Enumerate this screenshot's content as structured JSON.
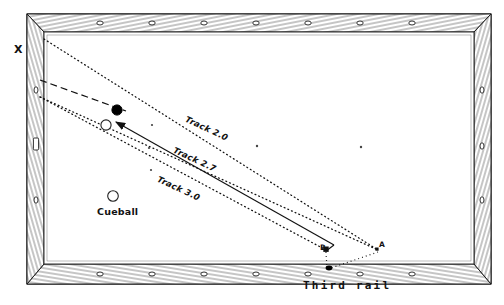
{
  "diagram": {
    "table": {
      "rail_color": "#1a1a1a",
      "cloth_color": "#ffffff",
      "frame_note": "wood-grain rails with diamond sights"
    },
    "labels": {
      "x": "X",
      "cueball": "Cueball",
      "third_rail": "Third  rail",
      "point_a": "A",
      "point_b": "B"
    },
    "tracks": [
      {
        "id": "track-2-0",
        "label": "Track 2.0",
        "value": 2.0,
        "style": "dotted"
      },
      {
        "id": "track-2-7",
        "label": "Track 2.7",
        "value": 2.7,
        "style": "dotted"
      },
      {
        "id": "track-3-0",
        "label": "Track 3.0",
        "value": 3.0,
        "style": "dotted"
      }
    ],
    "balls": [
      {
        "id": "object-ball",
        "name": "object-ball",
        "fill": "#000000",
        "cx": 117,
        "cy": 110,
        "r": 5.2
      },
      {
        "id": "target-ball",
        "name": "target-ball",
        "fill": "#ffffff",
        "cx": 106,
        "cy": 125,
        "r": 5.2
      },
      {
        "id": "cueball",
        "name": "cueball",
        "fill": "#ffffff",
        "cx": 113,
        "cy": 196,
        "r": 5.2
      }
    ],
    "markers": {
      "point_a": {
        "cx": 378,
        "cy": 250
      },
      "point_b": {
        "cx": 326,
        "cy": 250
      },
      "third_rail_spot": {
        "cx": 329,
        "cy": 267
      }
    },
    "cloth_spots": [
      {
        "cx": 152,
        "cy": 125
      },
      {
        "cx": 148,
        "cy": 148
      },
      {
        "cx": 151,
        "cy": 170
      },
      {
        "cx": 257,
        "cy": 146
      },
      {
        "cx": 360,
        "cy": 147
      }
    ],
    "geometry": {
      "playfield": {
        "x": 44,
        "y": 32,
        "w": 430,
        "h": 232
      },
      "track_2_0": {
        "from": [
          44,
          39
        ],
        "to": [
          378,
          250
        ]
      },
      "track_2_7": {
        "from": [
          40,
          96
        ],
        "to": [
          326,
          250
        ]
      },
      "track_3_0": {
        "from": [
          40,
          96
        ],
        "to": [
          378,
          250
        ]
      },
      "shot_line": {
        "from": [
          326,
          250
        ],
        "to": [
          112,
          122
        ]
      },
      "dashed_line": {
        "from": [
          40,
          80
        ],
        "to": [
          120,
          112
        ]
      }
    },
    "colors": {
      "ink": "#1a1a1a",
      "line": "#222222",
      "background": "#ffffff"
    }
  }
}
